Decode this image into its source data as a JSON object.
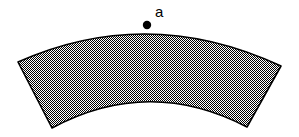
{
  "figure": {
    "width": 299,
    "height": 137,
    "background_color": "#ffffff",
    "outline_color": "#000000",
    "outline_width": 1.6,
    "fill": {
      "style": "checkerboard-dither-50",
      "dark_color": "#000000",
      "light_color": "#ffffff",
      "apparent_gray": "#b4b4b4",
      "cell_size_px": 1
    },
    "shape": {
      "type": "annulus-sector",
      "outer_arc": {
        "start": [
          18,
          62
        ],
        "apex": [
          147,
          25
        ],
        "end": [
          281,
          66
        ],
        "control": [
          148,
          4
        ]
      },
      "inner_arc": {
        "start": [
          247,
          127
        ],
        "apex": [
          150,
          93
        ],
        "end": [
          52,
          128
        ],
        "control": [
          149,
          76
        ]
      },
      "left_edge": {
        "from": [
          52,
          128
        ],
        "to": [
          18,
          62
        ]
      },
      "right_edge": {
        "from": [
          281,
          66
        ],
        "to": [
          247,
          127
        ]
      },
      "path_d": "M 18 62 Q 148 4 281 66 L 247 127 Q 149 76 52 128 Z"
    },
    "marker": {
      "label": "a",
      "shape": "filled-circle",
      "color": "#000000",
      "center_x": 147,
      "center_y": 25,
      "radius": 4.2,
      "label_x": 155,
      "label_y": 4
    }
  }
}
